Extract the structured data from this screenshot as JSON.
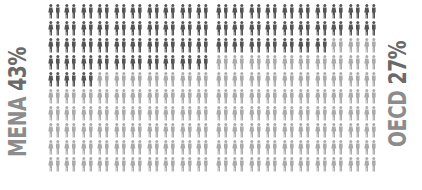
{
  "chart_data": {
    "type": "pictogram",
    "title": "",
    "units_per_block": 100,
    "grid": {
      "rows": 10,
      "columns": 10
    },
    "icon": "couple-icon",
    "colors": {
      "highlight": "#555555",
      "base": "#ababab",
      "label": "#7a7a7a"
    },
    "series": [
      {
        "name": "MENA",
        "value": 43,
        "label": "MENA 43%",
        "position": "left"
      },
      {
        "name": "OECD",
        "value": 27,
        "label": "OECD 27%",
        "position": "right"
      }
    ]
  },
  "labels": {
    "left": {
      "region": "MENA",
      "pct": "43%"
    },
    "right": {
      "region": "OECD",
      "pct": "27%"
    }
  }
}
